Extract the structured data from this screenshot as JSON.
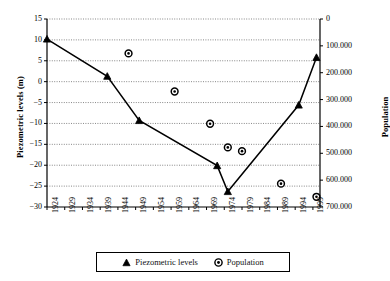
{
  "chart_data": {
    "type": "scatter",
    "title": "",
    "xlabel": "",
    "ylabel": "Piezometric levels (m)",
    "y2label": "Population",
    "grid": true,
    "legend_position": "bottom",
    "xlim": [
      1924,
      2001
    ],
    "xticks": [
      "1924",
      "1929",
      "1934",
      "1939",
      "1944",
      "1949",
      "1954",
      "1959",
      "1964",
      "1969",
      "1974",
      "1979",
      "1984",
      "1989",
      "1994",
      "1999"
    ],
    "ylim": [
      -30,
      15
    ],
    "yticks": [
      "15",
      "10",
      "5",
      "0",
      "-5",
      "-10",
      "-15",
      "-20",
      "-25",
      "-30"
    ],
    "y2lim": [
      0,
      700000
    ],
    "y2ticks": [
      "0",
      "100.000",
      "200.000",
      "300.000",
      "400.000",
      "500.000",
      "600.000",
      "700.000"
    ],
    "series": [
      {
        "name": "Piezometric levels",
        "axis": "left",
        "marker": "triangle",
        "line": true,
        "points": [
          {
            "x": 1924,
            "y": 10.2
          },
          {
            "x": 1941,
            "y": 1.3
          },
          {
            "x": 1950,
            "y": -9.3
          },
          {
            "x": 1972,
            "y": -20.1
          },
          {
            "x": 1975,
            "y": -26.3
          },
          {
            "x": 1995,
            "y": -5.6
          },
          {
            "x": 2000,
            "y": 5.8
          }
        ]
      },
      {
        "name": "Population",
        "axis": "right",
        "marker": "circle",
        "line": false,
        "points": [
          {
            "x": 1947,
            "y": 128000
          },
          {
            "x": 1960,
            "y": 270000
          },
          {
            "x": 1970,
            "y": 390000
          },
          {
            "x": 1975,
            "y": 478000
          },
          {
            "x": 1979,
            "y": 492000
          },
          {
            "x": 1990,
            "y": 613000
          },
          {
            "x": 2000,
            "y": 662000
          }
        ]
      }
    ]
  },
  "legend": {
    "items": [
      {
        "label": "Piezometric levels",
        "glyph": "triangle-marker"
      },
      {
        "label": "Population",
        "glyph": "circle-marker"
      }
    ]
  },
  "colors": {
    "axis": "#000000",
    "grid": "#555555",
    "series_line": "#000000",
    "marker_fill": "#ffffff",
    "marker_stroke": "#000000",
    "background": "#ffffff"
  }
}
